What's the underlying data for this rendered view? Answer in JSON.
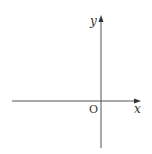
{
  "diagram": {
    "type": "coordinate-axes",
    "x_axis_label": "x",
    "y_axis_label": "y",
    "origin_label": "O",
    "colors": {
      "axis": "#555555",
      "text": "#333333",
      "background": "#ffffff"
    }
  }
}
